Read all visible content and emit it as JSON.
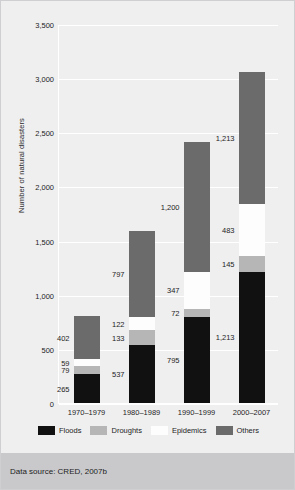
{
  "chart_data": {
    "type": "bar",
    "stacked": true,
    "title": "",
    "xlabel": "",
    "ylabel": "Number of natural disasters",
    "ylim": [
      0,
      3500
    ],
    "yticks": [
      "0",
      "500",
      "1,000",
      "1,500",
      "2,000",
      "2,500",
      "3,000",
      "3,500"
    ],
    "ytick_values": [
      0,
      500,
      1000,
      1500,
      2000,
      2500,
      3000,
      3500
    ],
    "grid": true,
    "legend_position": "bottom",
    "categories": [
      "1970–1979",
      "1980–1989",
      "1990–1999",
      "2000–2007"
    ],
    "series": [
      {
        "name": "Floods",
        "color": "#111111",
        "values": [
          265,
          537,
          795,
          1213
        ],
        "labels": [
          "265",
          "537",
          "795",
          "1,213"
        ]
      },
      {
        "name": "Droughts",
        "color": "#b6b6b6",
        "values": [
          79,
          133,
          72,
          145
        ],
        "labels": [
          "79",
          "133",
          "72",
          "145"
        ]
      },
      {
        "name": "Epidemics",
        "color": "#fdfdfd",
        "values": [
          59,
          122,
          347,
          483
        ],
        "labels": [
          "59",
          "122",
          "347",
          "483"
        ]
      },
      {
        "name": "Others",
        "color": "#6b6b6b",
        "values": [
          402,
          797,
          1200,
          1213
        ],
        "labels": [
          "402",
          "797",
          "1,200",
          "1,213"
        ]
      }
    ]
  },
  "footer": {
    "source_text": "Data source: CRED, 2007b"
  },
  "colors": {
    "background": "#efeff0",
    "footer_band": "#c9c9cb",
    "gridline": "#ffffff",
    "text": "#1d1d1d"
  }
}
